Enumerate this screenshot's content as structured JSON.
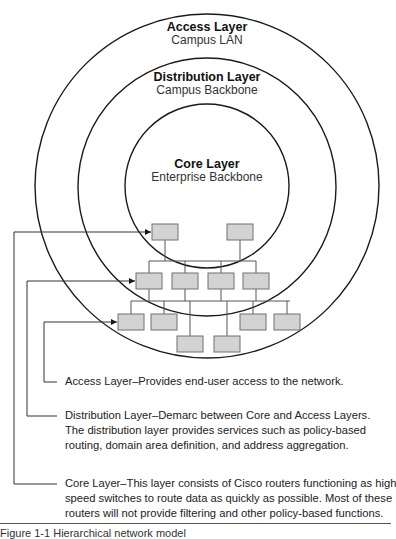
{
  "colors": {
    "line": "#1a1a1a",
    "box_fill": "#d3d3d3",
    "box_border": "#707070",
    "text": "#222222"
  },
  "layers": {
    "access": {
      "title": "Access Layer",
      "subtitle": "Campus LAN"
    },
    "distribution": {
      "title": "Distribution Layer",
      "subtitle": "Campus Backbone"
    },
    "core": {
      "title": "Core Layer",
      "subtitle": "Enterprise Backbone"
    }
  },
  "descriptions": {
    "access": {
      "lines": [
        "Access Layer–Provides end-user access to the network."
      ]
    },
    "distribution": {
      "lines": [
        "Distribution Layer–Demarc between Core and Access Layers.",
        "The distribution layer provides services such as policy-based",
        "routing, domain area definition, and address aggregation."
      ]
    },
    "core": {
      "lines": [
        "Core Layer–This layer consists of Cisco routers functioning as high",
        "speed switches to route data as quickly as possible.  Most of these",
        "routers will not provide filtering and other policy-based functions."
      ]
    }
  },
  "caption": "Figure 1-1  Hierarchical network model",
  "network": {
    "core_devices": 2,
    "distribution_devices": 4,
    "access_devices": 6
  }
}
